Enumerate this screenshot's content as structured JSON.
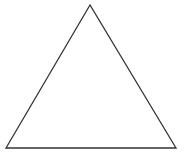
{
  "diagram": {
    "shape": "triangle",
    "type": "equilateral-outline",
    "stroke_color": "#333333",
    "fill_color": "#ffffff",
    "background": "#ffffff",
    "vertices": {
      "apex": [
        90,
        5
      ],
      "bottom_left": [
        6,
        148
      ],
      "bottom_right": [
        176,
        148
      ]
    }
  }
}
